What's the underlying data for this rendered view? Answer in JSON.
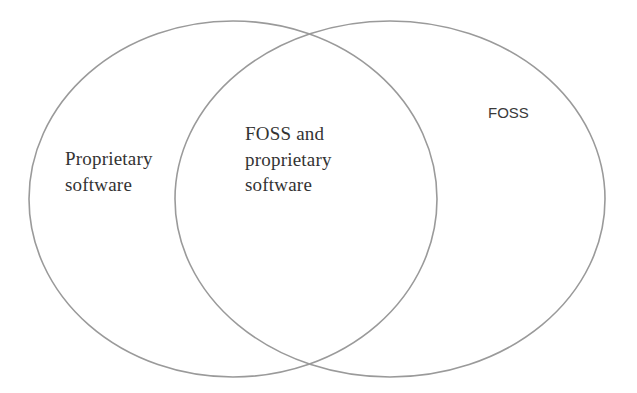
{
  "diagram": {
    "type": "venn",
    "stroke_color": "#9a9a9a",
    "sets": [
      {
        "id": "left",
        "label_lines": [
          "Proprietary",
          "software"
        ],
        "cx": 233,
        "cy": 199,
        "rx": 204,
        "ry": 178
      },
      {
        "id": "right",
        "label_lines": [
          "FOSS"
        ],
        "cx": 390,
        "cy": 199,
        "rx": 215,
        "ry": 178
      }
    ],
    "intersection": {
      "label_lines": [
        "FOSS and",
        "proprietary",
        "software"
      ]
    }
  }
}
